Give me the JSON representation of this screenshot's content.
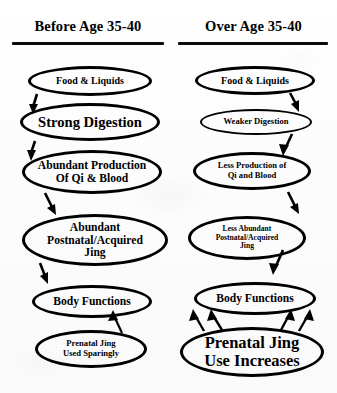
{
  "diagram": {
    "type": "comparison-flowchart",
    "background_color": "#fdfdfd",
    "line_color": "#000000",
    "columns": [
      {
        "id": "before",
        "header": "Before Age 35-40",
        "nodes": [
          {
            "id": "food-left",
            "label": "Food & Liquids"
          },
          {
            "id": "digestion-left",
            "label": "Strong Digestion"
          },
          {
            "id": "production-left",
            "label": "Abundant Production\nOf Qi & Blood"
          },
          {
            "id": "jing-left",
            "label": "Abundant\nPostnatal/Acquired\nJing"
          },
          {
            "id": "body-left",
            "label": "Body Functions"
          },
          {
            "id": "prenatal-left",
            "label": "Prenatal Jing\nUsed Sparingly"
          }
        ],
        "arrow_count_to_body_functions": 1
      },
      {
        "id": "over",
        "header": "Over Age 35-40",
        "nodes": [
          {
            "id": "food-right",
            "label": "Food & Liquids"
          },
          {
            "id": "digestion-right",
            "label": "Weaker Digestion"
          },
          {
            "id": "production-right",
            "label": "Less Production of\nQi and Blood"
          },
          {
            "id": "jing-right",
            "label": "Less Abundant\nPostnatal/Acquired\nJing"
          },
          {
            "id": "body-right",
            "label": "Body Functions"
          },
          {
            "id": "prenatal-right",
            "label": "Prenatal Jing\nUse Increases"
          }
        ],
        "arrow_count_to_body_functions": 4
      }
    ],
    "node_labels": {
      "food_left": "Food & Liquids",
      "digestion_left_line1": "Strong Digestion",
      "production_left_line1": "Abundant Production",
      "production_left_line2": "Of Qi & Blood",
      "jing_left_line1": "Abundant",
      "jing_left_line2": "Postnatal/Acquired",
      "jing_left_line3": "Jing",
      "body_left": "Body Functions",
      "prenatal_left_line1": "Prenatal Jing",
      "prenatal_left_line2": "Used Sparingly",
      "food_right": "Food & Liquids",
      "digestion_right_line1": "Weaker Digestion",
      "production_right_line1": "Less Production of",
      "production_right_line2": "Qi and Blood",
      "jing_right_line1": "Less Abundant",
      "jing_right_line2": "Postnatal/Acquired",
      "jing_right_line3": "Jing",
      "body_right": "Body Functions",
      "prenatal_right_line1": "Prenatal Jing",
      "prenatal_right_line2": "Use Increases"
    }
  }
}
